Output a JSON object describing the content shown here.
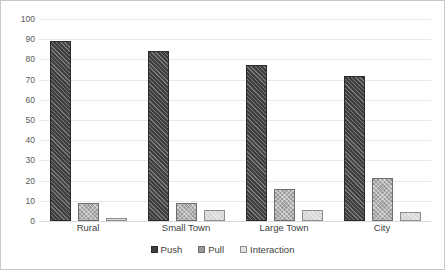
{
  "chart_data": {
    "type": "bar",
    "title": "",
    "xlabel": "",
    "ylabel": "",
    "ylim": [
      0,
      100
    ],
    "ytick_step": 10,
    "yticks": [
      "100",
      "90",
      "80",
      "70",
      "60",
      "50",
      "40",
      "30",
      "20",
      "10",
      "0"
    ],
    "grid": true,
    "legend_position": "bottom",
    "categories": [
      "Rural",
      "Small Town",
      "Large Town",
      "City"
    ],
    "series": [
      {
        "name": "Push",
        "values": [
          89,
          84,
          77,
          72
        ],
        "color": "#3f3f3f",
        "pattern": "diagonal-hatch"
      },
      {
        "name": "Pull",
        "values": [
          9,
          9,
          16,
          21.5
        ],
        "color": "#9a9a9a",
        "pattern": "dotted-crosshatch"
      },
      {
        "name": "Interaction",
        "values": [
          1.5,
          5.5,
          5.5,
          4.5
        ],
        "color": "#d6d6d6",
        "pattern": "light-fill"
      }
    ]
  }
}
